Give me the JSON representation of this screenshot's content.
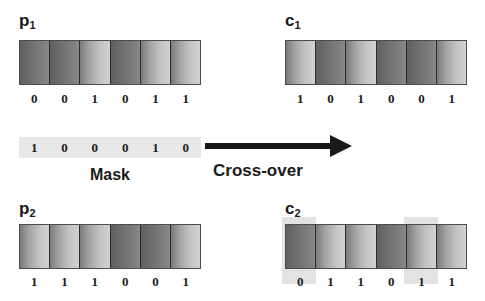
{
  "diagram": {
    "title": "Cross-over",
    "operation_label": "Cross-over",
    "mask_caption": "Mask",
    "colors": {
      "background": "#ffffff",
      "bit0": "#6e6e6e",
      "bit1": "#c2c2c2",
      "cell_border": "#2b2b2b",
      "bar_border": "#4d4d4d",
      "mask_band": "#e8e8e8",
      "highlight": "#e3e3e3",
      "text": "#1a1a1a",
      "arrow": "#1a1a1a"
    }
  },
  "parents": [
    {
      "id": "p1",
      "label_letter": "p",
      "label_sub": "1",
      "bits": [
        "0",
        "0",
        "1",
        "0",
        "1",
        "1"
      ]
    },
    {
      "id": "p2",
      "label_letter": "p",
      "label_sub": "2",
      "bits": [
        "1",
        "1",
        "1",
        "0",
        "0",
        "1"
      ]
    }
  ],
  "children": [
    {
      "id": "c1",
      "label_letter": "c",
      "label_sub": "1",
      "bits": [
        "1",
        "0",
        "1",
        "0",
        "0",
        "1"
      ]
    },
    {
      "id": "c2",
      "label_letter": "c",
      "label_sub": "2",
      "bits": [
        "0",
        "1",
        "1",
        "0",
        "1",
        "1"
      ],
      "highlighted_positions": [
        0,
        4
      ]
    }
  ],
  "mask": {
    "caption": "Mask",
    "bits": [
      "1",
      "0",
      "0",
      "0",
      "1",
      "0"
    ]
  }
}
